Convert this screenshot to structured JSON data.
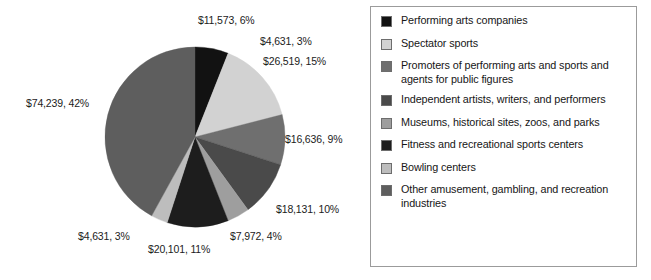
{
  "chart_data": {
    "type": "pie",
    "title": "",
    "value_prefix": "$",
    "units": "millions of dollars",
    "legend_position": "right",
    "grid": false,
    "start_angle_deg": 0,
    "direction": "clockwise",
    "total_value": 179803,
    "categories": [
      "Performing arts companies",
      "Spectator sports",
      "Promoters of performing arts and sports and agents for public figures",
      "Independent artists, writers, and performers",
      "Museums, historical sites, zoos, and parks",
      "Fitness and recreational sports centers",
      "Bowling centers",
      "Other amusement, gambling, and recreation industries"
    ],
    "values": [
      11573,
      26519,
      16636,
      18131,
      7972,
      20101,
      4631,
      74239
    ],
    "percents": [
      6,
      15,
      9,
      10,
      4,
      11,
      3,
      42
    ],
    "colors": [
      "#121212",
      "#d2d2d2",
      "#6f6f6f",
      "#4a4a4a",
      "#9e9e9e",
      "#1d1d1d",
      "#bdbdbd",
      "#5e5e5e"
    ],
    "slices": [
      {
        "label": "Performing arts companies",
        "value": 11573,
        "percent": 6,
        "color": "#121212",
        "data_label": "$11,573, 6%"
      },
      {
        "label": "Spectator sports",
        "value": 26519,
        "percent": 15,
        "color": "#d2d2d2",
        "data_label": "$26,519, 15%"
      },
      {
        "label": "Promoters of performing arts and sports and agents for public figures",
        "value": 16636,
        "percent": 9,
        "color": "#6f6f6f",
        "data_label": "$16,636, 9%"
      },
      {
        "label": "Independent artists, writers, and performers",
        "value": 18131,
        "percent": 10,
        "color": "#4a4a4a",
        "data_label": "$18,131, 10%"
      },
      {
        "label": "Museums, historical sites, zoos, and parks",
        "value": 7972,
        "percent": 4,
        "color": "#9e9e9e",
        "data_label": "$7,972, 4%"
      },
      {
        "label": "Fitness and recreational sports centers",
        "value": 20101,
        "percent": 11,
        "color": "#1d1d1d",
        "data_label": "$20,101, 11%"
      },
      {
        "label": "Bowling centers",
        "value": 4631,
        "percent": 3,
        "color": "#bdbdbd",
        "data_label": "$4,631, 3%"
      },
      {
        "label": "Other amusement, gambling, and recreation industries",
        "value": 74239,
        "percent": 42,
        "color": "#5e5e5e",
        "data_label": "$74,239, 42%"
      }
    ],
    "extra_annotations": [
      {
        "text": "$4,631, 3%",
        "note": "leader label near top-right pointing to Bowling centers slice"
      }
    ]
  },
  "pie_labels": {
    "top": "$11,573, 6%",
    "top_right_small": "$4,631, 3%",
    "top_right": "$26,519, 15%",
    "right": "$16,636, 9%",
    "lower_right": "$18,131, 10%",
    "bottom_right": "$7,972, 4%",
    "bottom_center": "$20,101, 11%",
    "bottom_left": "$4,631, 3%",
    "left": "$74,239, 42%"
  },
  "legend": {
    "items": [
      {
        "label": "Performing arts companies",
        "color": "#121212"
      },
      {
        "label": "Spectator sports",
        "color": "#d2d2d2"
      },
      {
        "label": "Promoters of performing arts and sports and agents for public figures",
        "color": "#6f6f6f"
      },
      {
        "label": "Independent artists, writers, and performers",
        "color": "#4a4a4a"
      },
      {
        "label": "Museums, historical sites, zoos, and parks",
        "color": "#9e9e9e"
      },
      {
        "label": "Fitness and recreational sports centers",
        "color": "#1d1d1d"
      },
      {
        "label": "Bowling centers",
        "color": "#bdbdbd"
      },
      {
        "label": "Other amusement, gambling, and recreation industries",
        "color": "#5e5e5e"
      }
    ]
  }
}
